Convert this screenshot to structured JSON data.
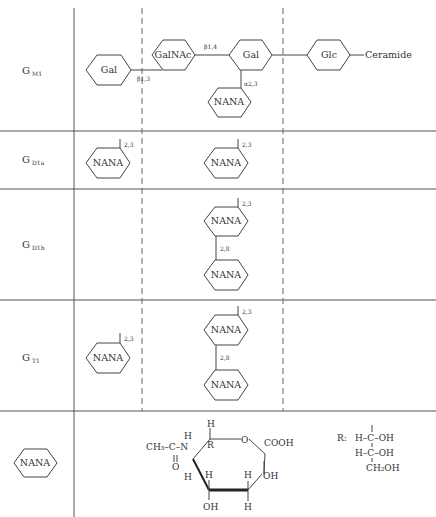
{
  "diagram": {
    "rows": [
      {
        "id": "GM1",
        "label": "G",
        "subscript": "M1",
        "chain": [
          "Gal",
          "GalNAc",
          "Gal",
          "Glc",
          "Ceramide"
        ],
        "linkages": {
          "gal_galnac": "β1,3",
          "galnac_gal": "β1,4",
          "nana_gal": "α2,3"
        },
        "branch": "NANA"
      },
      {
        "id": "GD1a",
        "label": "G",
        "subscript": "D1a",
        "left": {
          "unit": "NANA",
          "link": "2,3"
        },
        "middle": [
          {
            "unit": "NANA",
            "link": "2,3"
          }
        ]
      },
      {
        "id": "GD1b",
        "label": "G",
        "subscript": "D1b",
        "middle": [
          {
            "unit": "NANA",
            "link": "2,3"
          },
          {
            "unit": "NANA",
            "link": "2,8"
          }
        ]
      },
      {
        "id": "GT1",
        "label": "G",
        "subscript": "T1",
        "left": {
          "unit": "NANA",
          "link": "2,3"
        },
        "middle": [
          {
            "unit": "NANA",
            "link": "2,3"
          },
          {
            "unit": "NANA",
            "link": "2,8"
          }
        ]
      },
      {
        "id": "NANA-legend",
        "symbol": "NANA",
        "structure": {
          "acetyl": "CH₃–C–N",
          "carbonyl_o": "O",
          "h_n": "H",
          "ring_o": "O",
          "cooh": "COOH",
          "r": "R",
          "h": "H",
          "oh": "OH"
        },
        "r_group": {
          "label": "R:",
          "line1": "H–C–OH",
          "line2": "H–C–OH",
          "line3": "CH₂OH"
        }
      }
    ]
  }
}
